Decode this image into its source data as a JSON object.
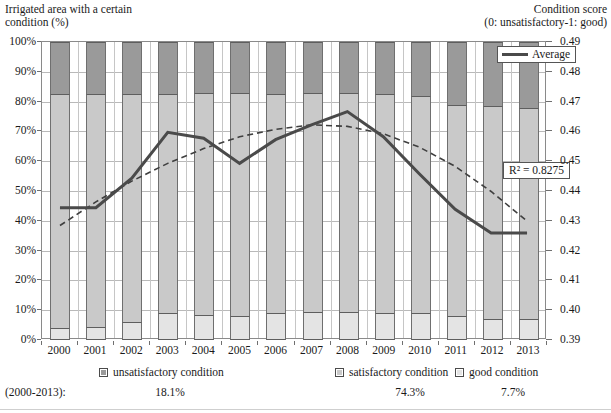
{
  "titles": {
    "left_axis": "Irrigated area with a certain\ncondition (%)",
    "right_axis": "Condition score\n(0: unsatisfactory-1: good)"
  },
  "annotations": {
    "r2_label": "R² = 0.8275",
    "average_legend": "Average"
  },
  "stats": {
    "period_label": "(2000-2013):",
    "unsatisfactory": "18.1%",
    "satisfactory": "74.3%",
    "good": "7.7%"
  },
  "legend": [
    {
      "label": "unsatisfactory condition",
      "color": "#9a9a9a"
    },
    {
      "label": "satisfactory condition",
      "color": "#c9c9c9"
    },
    {
      "label": "good condition",
      "color": "#e4e4e4"
    }
  ],
  "chart_data": {
    "type": "bar",
    "xlabel": "",
    "ylabel": "Irrigated area with a certain condition (%)",
    "y2label": "Condition score (0: unsatisfactory-1: good)",
    "ylim": [
      0,
      100
    ],
    "y2lim": [
      0.39,
      0.49
    ],
    "grid": true,
    "legend_position": "bottom",
    "stacked": true,
    "categories": [
      "2000",
      "2001",
      "2002",
      "2003",
      "2004",
      "2005",
      "2006",
      "2007",
      "2008",
      "2009",
      "2010",
      "2011",
      "2012",
      "2013"
    ],
    "y_ticks": [
      "0%",
      "10%",
      "20%",
      "30%",
      "40%",
      "50%",
      "60%",
      "70%",
      "80%",
      "90%",
      "100%"
    ],
    "y2_ticks": [
      "0.39",
      "0.40",
      "0.41",
      "0.42",
      "0.43",
      "0.44",
      "0.45",
      "0.46",
      "0.47",
      "0.48",
      "0.49"
    ],
    "series": [
      {
        "name": "good condition",
        "axis": "left",
        "kind": "bar",
        "values": [
          4.0,
          4.5,
          6.0,
          9.0,
          8.5,
          8.0,
          9.0,
          9.5,
          9.5,
          9.0,
          9.0,
          8.0,
          7.0,
          7.0
        ]
      },
      {
        "name": "satisfactory condition",
        "axis": "left",
        "kind": "bar",
        "values": [
          78.5,
          78.0,
          76.5,
          73.5,
          74.5,
          75.0,
          73.5,
          73.5,
          73.5,
          73.5,
          73.0,
          71.0,
          71.5,
          71.0
        ]
      },
      {
        "name": "unsatisfactory condition",
        "axis": "left",
        "kind": "bar",
        "values": [
          17.5,
          17.5,
          17.5,
          17.5,
          17.0,
          17.0,
          17.5,
          17.0,
          17.0,
          17.5,
          18.0,
          21.0,
          21.5,
          22.0
        ]
      },
      {
        "name": "Average",
        "axis": "right",
        "kind": "line",
        "style": "solid",
        "values": [
          0.434,
          0.434,
          0.444,
          0.4595,
          0.4575,
          0.449,
          0.457,
          0.462,
          0.4665,
          0.458,
          0.4455,
          0.4335,
          0.4255,
          0.4255
        ]
      },
      {
        "name": "Trend (polynomial)",
        "axis": "right",
        "kind": "line",
        "style": "dashed",
        "values": [
          0.428,
          0.436,
          0.443,
          0.449,
          0.454,
          0.458,
          0.4605,
          0.462,
          0.4615,
          0.459,
          0.4545,
          0.448,
          0.4395,
          0.4295
        ]
      }
    ],
    "stacked_tops": {
      "good_top": [
        4.0,
        4.5,
        6.0,
        9.0,
        8.5,
        8.0,
        9.0,
        9.5,
        9.5,
        9.0,
        9.0,
        8.0,
        7.0,
        7.0
      ],
      "satisfactory_top": [
        82.5,
        82.5,
        82.5,
        82.5,
        83.0,
        83.0,
        82.5,
        83.0,
        83.0,
        82.5,
        82.0,
        79.0,
        78.5,
        78.0
      ]
    },
    "annotations": [
      {
        "text": "R² = 0.8275",
        "for": "Trend (polynomial)"
      }
    ],
    "period_averages": {
      "label": "(2000-2013):",
      "unsatisfactory condition": 18.1,
      "satisfactory condition": 74.3,
      "good condition": 7.7
    }
  }
}
